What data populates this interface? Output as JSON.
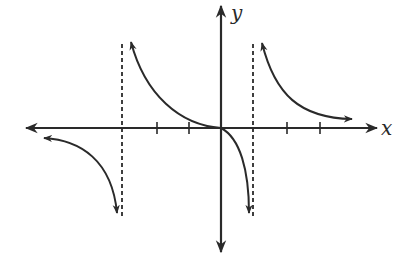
{
  "graph": {
    "axis_labels": {
      "x": "x",
      "y": "y"
    },
    "colors": {
      "stroke": "#2a2a2a",
      "background": "#ffffff"
    },
    "x_axis": {
      "ticks_left_of_origin": 3,
      "ticks_right_of_origin": 3,
      "tick_pixel_x": [
        122,
        157,
        189,
        253,
        287,
        320
      ]
    },
    "y_axis": {
      "ticks": 0
    },
    "vertical_asymptotes": [
      {
        "position": "left",
        "x_tick_index": -3,
        "style": "dashed"
      },
      {
        "position": "right",
        "x_tick_index": 1,
        "style": "dashed"
      }
    ],
    "branches": [
      {
        "name": "far-left",
        "description": "approaches x-axis from below as x→-∞, falls to -∞ near left asymptote"
      },
      {
        "name": "middle",
        "description": "rises to +∞ near left asymptote, passes through origin, falls to -∞ near right asymptote"
      },
      {
        "name": "far-right",
        "description": "rises to +∞ near right asymptote, approaches x-axis from above as x→+∞"
      }
    ]
  }
}
